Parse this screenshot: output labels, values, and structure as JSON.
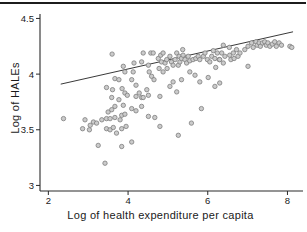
{
  "figure": {
    "background": "#ffffff",
    "top_rule_color": "#1c1c1c"
  },
  "chart_data": {
    "type": "scatter",
    "title": "",
    "xlabel": "Log of health expenditure per capita",
    "ylabel": "Log of HALEs",
    "x_ticks": [
      2,
      4,
      6,
      8
    ],
    "y_ticks": [
      3,
      3.5,
      4,
      4.5
    ],
    "xlim": [
      1.79,
      8.39
    ],
    "ylim": [
      2.95,
      4.54
    ],
    "grid": false,
    "legend": "none",
    "axis_color": "#2a2a2a",
    "tick_label_color": "#1a1a1a",
    "marker": {
      "shape": "circle",
      "fill": "#cbcbcb",
      "stroke": "#7d7d7d",
      "radius_px": 2.2
    },
    "trend_line": {
      "x1": 2.31,
      "y1": 3.91,
      "x2": 8.14,
      "y2": 4.38,
      "color": "#222222"
    },
    "points": [
      [
        2.38,
        3.6
      ],
      [
        2.86,
        3.51
      ],
      [
        2.92,
        3.59
      ],
      [
        3.03,
        3.5
      ],
      [
        3.05,
        3.54
      ],
      [
        3.13,
        3.57
      ],
      [
        3.21,
        3.56
      ],
      [
        3.25,
        3.36
      ],
      [
        3.34,
        3.59
      ],
      [
        3.42,
        3.2
      ],
      [
        3.46,
        3.88
      ],
      [
        3.46,
        3.6
      ],
      [
        3.46,
        3.51
      ],
      [
        3.5,
        3.66
      ],
      [
        3.55,
        3.6
      ],
      [
        3.55,
        3.5
      ],
      [
        3.59,
        3.79
      ],
      [
        3.59,
        3.68
      ],
      [
        3.6,
        4.18
      ],
      [
        3.61,
        3.86
      ],
      [
        3.63,
        3.52
      ],
      [
        3.67,
        3.96
      ],
      [
        3.67,
        3.71
      ],
      [
        3.67,
        3.61
      ],
      [
        3.71,
        3.47
      ],
      [
        3.77,
        3.95
      ],
      [
        3.77,
        3.77
      ],
      [
        3.8,
        3.59
      ],
      [
        3.84,
        3.63
      ],
      [
        3.84,
        3.51
      ],
      [
        3.84,
        3.35
      ],
      [
        3.85,
        3.87
      ],
      [
        3.88,
        4.07
      ],
      [
        3.88,
        3.72
      ],
      [
        3.92,
        4.02
      ],
      [
        3.92,
        3.83
      ],
      [
        3.92,
        3.64
      ],
      [
        3.95,
        3.53
      ],
      [
        3.98,
        3.81
      ],
      [
        4.09,
        3.95
      ],
      [
        4.09,
        3.69
      ],
      [
        4.09,
        3.39
      ],
      [
        4.13,
        4.02
      ],
      [
        4.15,
        4.1
      ],
      [
        4.2,
        3.9
      ],
      [
        4.2,
        3.8
      ],
      [
        4.2,
        3.67
      ],
      [
        4.28,
        3.83
      ],
      [
        4.34,
        4.11
      ],
      [
        4.34,
        3.79
      ],
      [
        4.34,
        3.71
      ],
      [
        4.38,
        4.19
      ],
      [
        4.38,
        3.79
      ],
      [
        4.47,
        3.86
      ],
      [
        4.51,
        4.08
      ],
      [
        4.51,
        3.81
      ],
      [
        4.51,
        3.62
      ],
      [
        4.53,
        4.02
      ],
      [
        4.57,
        4.19
      ],
      [
        4.59,
        3.98
      ],
      [
        4.63,
        4.19
      ],
      [
        4.65,
        3.95
      ],
      [
        4.67,
        3.61
      ],
      [
        4.76,
        4.14
      ],
      [
        4.78,
        4.05
      ],
      [
        4.8,
        3.8
      ],
      [
        4.8,
        3.53
      ],
      [
        4.82,
        4.17
      ],
      [
        4.84,
        4.11
      ],
      [
        4.88,
        4.19
      ],
      [
        4.88,
        4.02
      ],
      [
        4.93,
        4.1
      ],
      [
        4.97,
        4.13
      ],
      [
        4.98,
        4.05
      ],
      [
        5.05,
        4.16
      ],
      [
        5.05,
        3.89
      ],
      [
        5.09,
        4.11
      ],
      [
        5.13,
        4.08
      ],
      [
        5.13,
        3.93
      ],
      [
        5.18,
        4.13
      ],
      [
        5.22,
        4.19
      ],
      [
        5.22,
        3.84
      ],
      [
        5.26,
        4.08
      ],
      [
        5.26,
        3.45
      ],
      [
        5.28,
        4.16
      ],
      [
        5.3,
        4.11
      ],
      [
        5.34,
        4.14
      ],
      [
        5.34,
        3.95
      ],
      [
        5.37,
        4.22
      ],
      [
        5.38,
        4.17
      ],
      [
        5.43,
        4.13
      ],
      [
        5.47,
        4.1
      ],
      [
        5.51,
        4.16
      ],
      [
        5.55,
        4.12
      ],
      [
        5.55,
        4.02
      ],
      [
        5.59,
        3.56
      ],
      [
        5.63,
        4.13
      ],
      [
        5.68,
        3.99
      ],
      [
        5.7,
        4.14
      ],
      [
        5.76,
        4.16
      ],
      [
        5.8,
        4.13
      ],
      [
        5.8,
        3.93
      ],
      [
        5.84,
        3.69
      ],
      [
        5.89,
        4.16
      ],
      [
        5.93,
        4.19
      ],
      [
        5.99,
        4.13
      ],
      [
        6.01,
        3.97
      ],
      [
        6.05,
        4.11
      ],
      [
        6.1,
        4.16
      ],
      [
        6.14,
        4.21
      ],
      [
        6.18,
        4.14
      ],
      [
        6.18,
        3.89
      ],
      [
        6.2,
        4.06
      ],
      [
        6.24,
        4.19
      ],
      [
        6.29,
        4.13
      ],
      [
        6.3,
        4.13
      ],
      [
        6.3,
        3.92
      ],
      [
        6.35,
        4.19
      ],
      [
        6.39,
        4.26
      ],
      [
        6.39,
        4.1
      ],
      [
        6.43,
        4.16
      ],
      [
        6.54,
        4.24
      ],
      [
        6.55,
        4.17
      ],
      [
        6.58,
        4.13
      ],
      [
        6.64,
        4.19
      ],
      [
        6.66,
        4.14
      ],
      [
        6.72,
        4.22
      ],
      [
        6.76,
        4.16
      ],
      [
        6.81,
        4.19
      ],
      [
        6.93,
        4.22
      ],
      [
        7.01,
        4.25
      ],
      [
        7.01,
        4.07
      ],
      [
        7.1,
        4.28
      ],
      [
        7.14,
        4.24
      ],
      [
        7.21,
        4.29
      ],
      [
        7.24,
        4.26
      ],
      [
        7.29,
        4.28
      ],
      [
        7.32,
        4.25
      ],
      [
        7.37,
        4.28
      ],
      [
        7.43,
        4.29
      ],
      [
        7.47,
        4.26
      ],
      [
        7.51,
        4.28
      ],
      [
        7.56,
        4.25
      ],
      [
        7.62,
        4.27
      ],
      [
        7.68,
        4.29
      ],
      [
        7.72,
        4.25
      ],
      [
        7.79,
        4.28
      ],
      [
        7.85,
        4.26
      ],
      [
        8.06,
        4.25
      ],
      [
        8.11,
        4.24
      ]
    ]
  }
}
